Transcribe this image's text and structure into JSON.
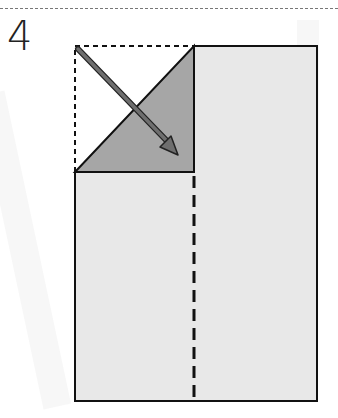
{
  "step": {
    "number": "4"
  },
  "colors": {
    "paper_fill": "#e8e8e8",
    "folded_flap_fill": "#a6a6a6",
    "outline": "#111111",
    "arrow_fill": "#6e6e6e",
    "arrow_outline": "#222222",
    "fold_guide": "#111111",
    "background": "#ffffff"
  },
  "diagram": {
    "paper": {
      "left": 75,
      "top": 46,
      "right": 317,
      "bottom": 401
    },
    "center_crease_x": 194,
    "flap_triangle": [
      [
        75,
        172
      ],
      [
        194,
        46
      ],
      [
        194,
        172
      ]
    ],
    "original_corner_outline": [
      [
        75,
        172
      ],
      [
        75,
        46
      ],
      [
        194,
        46
      ]
    ],
    "arrow": {
      "from": [
        77,
        48
      ],
      "to": [
        178,
        155
      ]
    }
  }
}
